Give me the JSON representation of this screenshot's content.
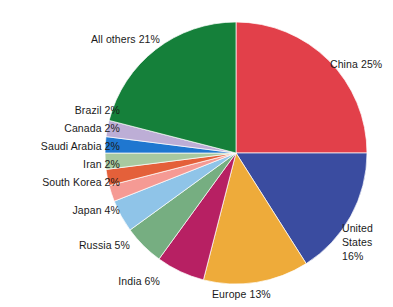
{
  "chart_data": {
    "type": "pie",
    "title": "",
    "subtitle": "",
    "xlabel": "",
    "ylabel": "",
    "legend_position": "none",
    "grid": false,
    "units": "percent",
    "start_angle_deg": 0,
    "direction": "clockwise",
    "categories": [
      "China",
      "United States",
      "Europe",
      "India",
      "Russia",
      "Japan",
      "South Korea",
      "Iran",
      "Saudi Arabia",
      "Canada",
      "Brazil",
      "All others"
    ],
    "values": [
      25,
      16,
      13,
      6,
      5,
      4,
      2,
      2,
      2,
      2,
      2,
      21
    ],
    "colors": [
      "#e2404a",
      "#3a4ca0",
      "#eeab3a",
      "#b72063",
      "#76ae81",
      "#8fc4e8",
      "#f59a94",
      "#e4603a",
      "#a8c9a0",
      "#1f77d0",
      "#bdaed6",
      "#15803a"
    ],
    "slices": [
      {
        "label": "China 25%",
        "name": "China",
        "value": 25,
        "color": "#e2404a"
      },
      {
        "label": "United States 16%",
        "name": "United States",
        "value": 16,
        "color": "#3a4ca0"
      },
      {
        "label": "Europe 13%",
        "name": "Europe",
        "value": 13,
        "color": "#eeab3a"
      },
      {
        "label": "India 6%",
        "name": "India",
        "value": 6,
        "color": "#b72063"
      },
      {
        "label": "Russia 5%",
        "name": "Russia",
        "value": 5,
        "color": "#76ae81"
      },
      {
        "label": "Japan 4%",
        "name": "Japan",
        "value": 4,
        "color": "#8fc4e8"
      },
      {
        "label": "South Korea 2%",
        "name": "South Korea",
        "value": 2,
        "color": "#f59a94"
      },
      {
        "label": "Iran 2%",
        "name": "Iran",
        "value": 2,
        "color": "#e4603a"
      },
      {
        "label": "Saudi Arabia 2%",
        "name": "Saudi Arabia",
        "value": 2,
        "color": "#a8c9a0"
      },
      {
        "label": "Canada 2%",
        "name": "Canada",
        "value": 2,
        "color": "#1f77d0"
      },
      {
        "label": "Brazil 2%",
        "name": "Brazil",
        "value": 2,
        "color": "#bdaed6"
      },
      {
        "label": "All others 21%",
        "name": "All others",
        "value": 21,
        "color": "#15803a"
      }
    ]
  },
  "labels": {
    "all_others": "All others 21%",
    "china": "China 25%",
    "brazil": "Brazil 2%",
    "canada": "Canada 2%",
    "saudi_arabia": "Saudi Arabia 2%",
    "iran": "Iran 2%",
    "south_korea": "South Korea 2%",
    "japan": "Japan 4%",
    "russia": "Russia 5%",
    "india": "India 6%",
    "europe": "Europe 13%",
    "united_states": "United\nStates\n16%"
  }
}
